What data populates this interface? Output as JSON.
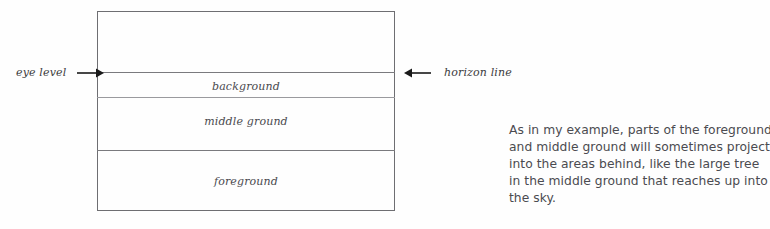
{
  "diagram": {
    "zones": [
      {
        "label": "background"
      },
      {
        "label": "middle ground"
      },
      {
        "label": "foreground"
      }
    ]
  },
  "annotations": {
    "left": {
      "label": "eye level",
      "arrow_icon": "arrow-right-icon"
    },
    "right": {
      "label": "horizon line",
      "arrow_icon": "arrow-left-icon"
    }
  },
  "body_copy": {
    "lines": [
      "As in my example, parts of the foreground",
      "and middle ground will sometimes project",
      "into the areas behind, like the large tree",
      "in the middle ground that reaches up into",
      "the sky."
    ]
  },
  "colors": {
    "page_background": "#fefefe",
    "rule": "#6e6e72",
    "label_text": "#4a4a4e",
    "body_text": "#4b4b50",
    "arrow": "#1a1a1a"
  }
}
